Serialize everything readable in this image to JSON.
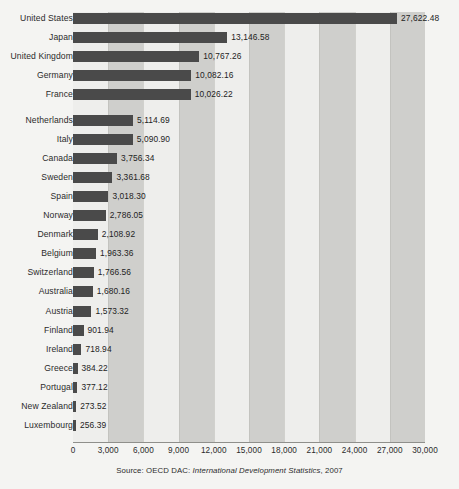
{
  "chart_data": {
    "type": "bar",
    "orientation": "horizontal",
    "title": "",
    "xlabel": "",
    "ylabel": "",
    "xlim": [
      0,
      30000
    ],
    "xticks": [
      "0",
      "3,000",
      "6,000",
      "9,000",
      "12,000",
      "15,000",
      "18,000",
      "21,000",
      "24,000",
      "27,000",
      "30,000"
    ],
    "xtick_values": [
      0,
      3000,
      6000,
      9000,
      12000,
      15000,
      18000,
      21000,
      24000,
      27000,
      30000
    ],
    "grid": true,
    "legend": false,
    "bar_color": "#4a4a4a",
    "band_light": "#eeeeec",
    "band_dark": "#cfcfcc",
    "background": "#f4f4f2",
    "categories": [
      "United States",
      "Japan",
      "United Kingdom",
      "Germany",
      "France",
      "Netherlands",
      "Italy",
      "Canada",
      "Sweden",
      "Spain",
      "Norway",
      "Denmark",
      "Belgium",
      "Switzerland",
      "Australia",
      "Austria",
      "Finland",
      "Ireland",
      "Greece",
      "Portugal",
      "New Zealand",
      "Luxembourg"
    ],
    "values": [
      27622.48,
      13146.58,
      10767.26,
      10082.16,
      10026.22,
      5114.69,
      5090.9,
      3756.34,
      3361.68,
      3018.3,
      2786.05,
      2108.92,
      1963.36,
      1766.56,
      1680.16,
      1573.32,
      901.94,
      718.94,
      384.22,
      377.12,
      273.52,
      256.39
    ],
    "value_labels": [
      "27,622.48",
      "13,146.58",
      "10,767.26",
      "10,082.16",
      "10,026.22",
      "5,114.69",
      "5,090.90",
      "3,756.34",
      "3,361.68",
      "3,018.30",
      "2,786.05",
      "2,108.92",
      "1,963.36",
      "1,766.56",
      "1,680.16",
      "1,573.32",
      "901.94",
      "718.94",
      "384.22",
      "377.12",
      "273.52",
      "256.39"
    ],
    "group_break_after_index": 4
  },
  "source": {
    "prefix": "Source: OECD DAC: ",
    "italic": "International Development Statistics",
    "suffix": ", 2007"
  }
}
